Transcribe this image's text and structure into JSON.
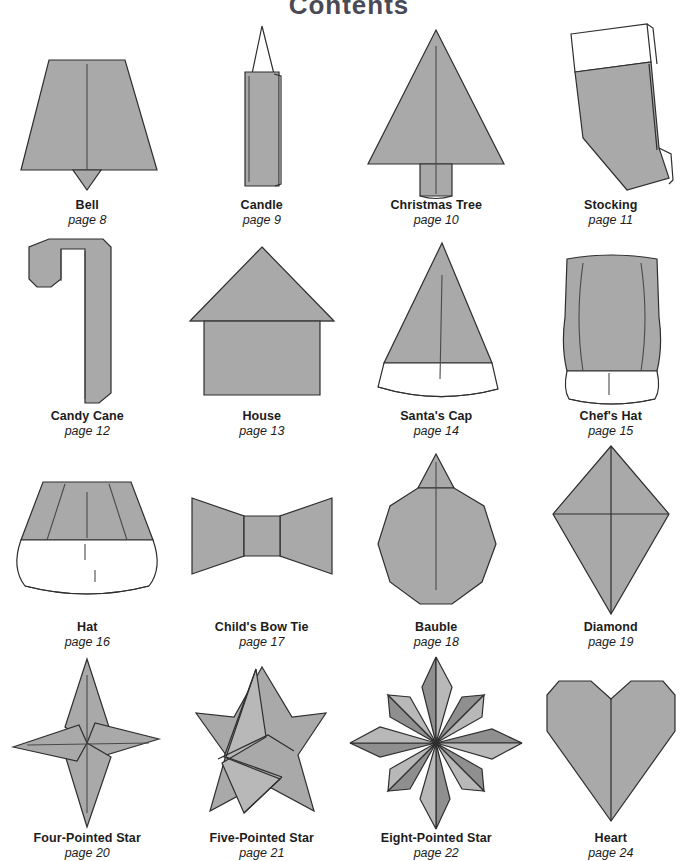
{
  "page": {
    "title": "Contents",
    "title_color": "#4a4a55",
    "background_color": "#ffffff",
    "shape_fill_color": "#a9a9a9",
    "shape_outline_color": "#2e2e2e",
    "label_color": "#1c1c1c"
  },
  "items": [
    {
      "name": "Bell",
      "page": "page 8",
      "icon": "bell-origami-figure"
    },
    {
      "name": "Candle",
      "page": "page 9",
      "icon": "candle-origami-figure"
    },
    {
      "name": "Christmas Tree",
      "page": "page 10",
      "icon": "christmas-tree-origami-figure"
    },
    {
      "name": "Stocking",
      "page": "page 11",
      "icon": "stocking-origami-figure"
    },
    {
      "name": "Candy Cane",
      "page": "page 12",
      "icon": "candy-cane-origami-figure"
    },
    {
      "name": "House",
      "page": "page 13",
      "icon": "house-origami-figure"
    },
    {
      "name": "Santa's Cap",
      "page": "page 14",
      "icon": "santas-cap-origami-figure"
    },
    {
      "name": "Chef's Hat",
      "page": "page 15",
      "icon": "chefs-hat-origami-figure"
    },
    {
      "name": "Hat",
      "page": "page 16",
      "icon": "hat-origami-figure"
    },
    {
      "name": "Child's Bow Tie",
      "page": "page 17",
      "icon": "bow-tie-origami-figure"
    },
    {
      "name": "Bauble",
      "page": "page 18",
      "icon": "bauble-origami-figure"
    },
    {
      "name": "Diamond",
      "page": "page 19",
      "icon": "diamond-origami-figure"
    },
    {
      "name": "Four-Pointed Star",
      "page": "page 20",
      "icon": "four-pointed-star-origami-figure"
    },
    {
      "name": "Five-Pointed Star",
      "page": "page 21",
      "icon": "five-pointed-star-origami-figure"
    },
    {
      "name": "Eight-Pointed Star",
      "page": "page 22",
      "icon": "eight-pointed-star-origami-figure"
    },
    {
      "name": "Heart",
      "page": "page 24",
      "icon": "heart-origami-figure"
    }
  ]
}
